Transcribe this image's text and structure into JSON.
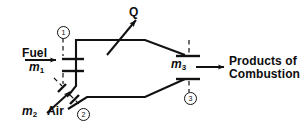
{
  "diagram": {
    "type": "combustion-chamber-control-volume-schematic",
    "stroke_color": "#111111",
    "background_color": "#ffffff",
    "inlets": [
      {
        "name": "fuel-inlet",
        "label": "Fuel",
        "mass_flow_symbol": "m",
        "mass_flow_subscript": "1",
        "state_number": "1",
        "flow_direction": "right"
      },
      {
        "name": "air-inlet",
        "label": "Air",
        "mass_flow_symbol": "m",
        "mass_flow_subscript": "2",
        "state_number": "2",
        "flow_direction": "up-right"
      }
    ],
    "outlets": [
      {
        "name": "products-outlet",
        "label_line_1": "Products of",
        "label_line_2": "Combustion",
        "mass_flow_symbol": "m",
        "mass_flow_subscript": "3",
        "state_number": "3",
        "flow_direction": "right"
      }
    ],
    "heat_transfer": {
      "name": "heat-transfer-out",
      "label": "Q",
      "direction": "out-up-right"
    }
  }
}
